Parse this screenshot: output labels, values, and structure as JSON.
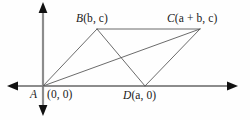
{
  "figure": {
    "background_color": "#fefefe",
    "line_color": "#5a5a5a",
    "axis_color": "#8c8c8c",
    "text_color": "#1a1a1a"
  },
  "axes": {
    "x_axis_label": "x-axis",
    "y_axis_label": "y-axis",
    "origin_x": 43,
    "origin_y": 86
  },
  "points": {
    "A": {
      "name": "A",
      "coords": "(0, 0)",
      "full": "A (0, 0)",
      "px": 43,
      "py": 86
    },
    "B": {
      "name": "B",
      "coords": "(b, c)",
      "full": "B(b, c)",
      "px": 97,
      "py": 29
    },
    "C": {
      "name": "C",
      "coords": "(a + b, c)",
      "full": "C(a + b, c)",
      "px": 200,
      "py": 29
    },
    "D": {
      "name": "D",
      "coords": "(a, 0)",
      "full": "D(a, 0)",
      "px": 145,
      "py": 86
    }
  },
  "segments": [
    {
      "name": "side-AB",
      "from": "A",
      "to": "B"
    },
    {
      "name": "side-BC",
      "from": "B",
      "to": "C"
    },
    {
      "name": "side-DC",
      "from": "D",
      "to": "C"
    },
    {
      "name": "side-AD",
      "from": "A",
      "to": "D"
    },
    {
      "name": "diagonal-AC",
      "from": "A",
      "to": "C"
    },
    {
      "name": "diagonal-BD",
      "from": "B",
      "to": "D"
    }
  ]
}
